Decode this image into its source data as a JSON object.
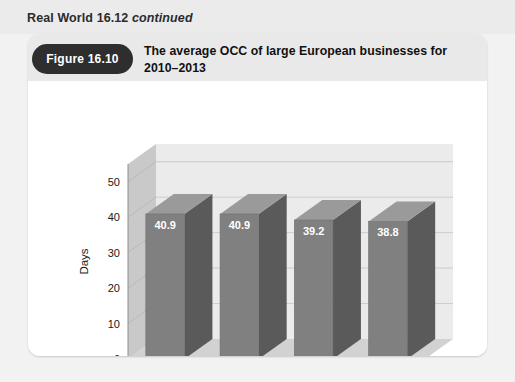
{
  "header_strip": {
    "title_bold": "Real World 16.12",
    "title_italic": "continued"
  },
  "figure": {
    "badge_label": "Figure 16.10",
    "title": "The average OCC of large European businesses for 2010–2013"
  },
  "colors": {
    "badge_bg": "#2e2e2e",
    "header_band": "#e9e9e9",
    "page_bg": "#f2f2f2",
    "card_bg": "#ffffff",
    "bar_front": "#808080",
    "bar_side": "#5a5a5a",
    "bar_top": "#9a9a9a",
    "wall_back": "#ebebeb",
    "wall_left": "#c9c9c9",
    "floor": "#d2d2d2",
    "gridline": "#c4c4c4"
  },
  "chart_data": {
    "type": "bar",
    "title": "The average OCC of large European businesses for 2010–2013",
    "categories": [
      "2010",
      "2011",
      "2012",
      "2013"
    ],
    "values": [
      40.9,
      40.9,
      39.2,
      38.8
    ],
    "data_labels": [
      "40.9",
      "40.9",
      "39.2",
      "38.8"
    ],
    "xlabel": "",
    "ylabel": "Days",
    "ylim": [
      0,
      55
    ],
    "yticks": [
      0,
      10,
      20,
      30,
      40,
      50
    ],
    "ytick_labels": [
      "0",
      "10",
      "20",
      "30",
      "40",
      "50"
    ],
    "grid": true,
    "legend": false,
    "style": "3d-column"
  }
}
